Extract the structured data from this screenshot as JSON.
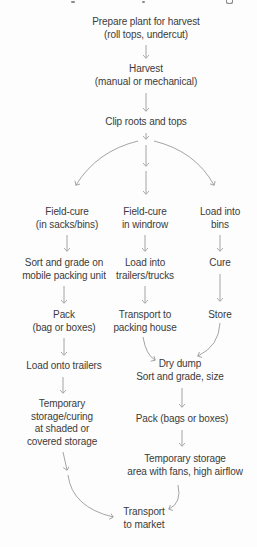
{
  "diagram": {
    "colors": {
      "text": "#3b3b3b",
      "arrow_line": "#9a9a9a",
      "arrow_head": "#666666",
      "background": "#fdfdfd"
    },
    "nodes": {
      "prepare": {
        "lines": [
          "Prepare plant for harvest",
          "(roll tops, undercut)"
        ]
      },
      "harvest": {
        "lines": [
          "Harvest",
          "(manual or mechanical)"
        ]
      },
      "clip": {
        "lines": [
          "Clip roots and tops"
        ]
      },
      "field_cure_sacks": {
        "lines": [
          "Field-cure",
          "(in sacks/bins)"
        ]
      },
      "field_cure_windrow": {
        "lines": [
          "Field-cure",
          "in windrow"
        ]
      },
      "load_into_bins": {
        "lines": [
          "Load into",
          "bins"
        ]
      },
      "sort_grade_mobile": {
        "lines": [
          "Sort and grade on",
          "mobile packing unit"
        ]
      },
      "load_trailers_trucks": {
        "lines": [
          "Load into",
          "trailers/trucks"
        ]
      },
      "cure": {
        "lines": [
          "Cure"
        ]
      },
      "pack_bag_boxes": {
        "lines": [
          "Pack",
          "(bag or boxes)"
        ]
      },
      "transport_packing_house": {
        "lines": [
          "Transport to",
          "packing house"
        ]
      },
      "store": {
        "lines": [
          "Store"
        ]
      },
      "load_onto_trailers": {
        "lines": [
          "Load onto trailers"
        ]
      },
      "dry_dump": {
        "lines": [
          "Dry dump",
          "Sort and grade, size"
        ]
      },
      "temp_storage_shaded": {
        "lines": [
          "Temporary",
          "storage/curing",
          "at shaded or",
          "covered storage"
        ]
      },
      "pack_bags_boxes": {
        "lines": [
          "Pack (bags or boxes)"
        ]
      },
      "temp_storage_fans": {
        "lines": [
          "Temporary storage",
          "area with fans, high airflow"
        ]
      },
      "transport_market": {
        "lines": [
          "Transport",
          "to market"
        ]
      }
    }
  }
}
